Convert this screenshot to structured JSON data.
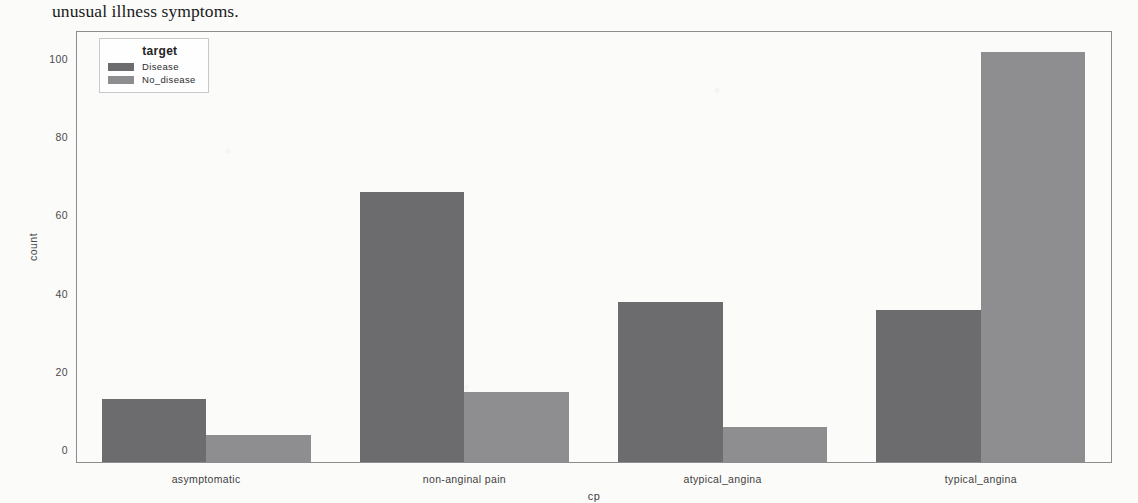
{
  "document": {
    "body_text": "unusual illness symptoms."
  },
  "figure": {
    "legend_title": "target",
    "colors": {
      "disease": "#6c6c6e",
      "no_disease": "#8e8e90",
      "axis": "#8d8d90",
      "text": "#3f3f41"
    }
  },
  "chart_data": {
    "type": "bar",
    "title": "",
    "xlabel": "cp",
    "ylabel": "count",
    "categories": [
      "asymptomatic",
      "non-anginal pain",
      "atypical_angina",
      "typical_angina"
    ],
    "series": [
      {
        "name": "Disease",
        "values": [
          16,
          69,
          41,
          39
        ],
        "color": "#6c6c6e"
      },
      {
        "name": "No_disease",
        "values": [
          7,
          18,
          9,
          105
        ],
        "color": "#8e8e90"
      }
    ],
    "ylim": [
      0,
      110
    ],
    "yticks": [
      0,
      20,
      40,
      60,
      80,
      100
    ],
    "grid": false,
    "legend_position": "upper-left",
    "legend_title": "target"
  }
}
